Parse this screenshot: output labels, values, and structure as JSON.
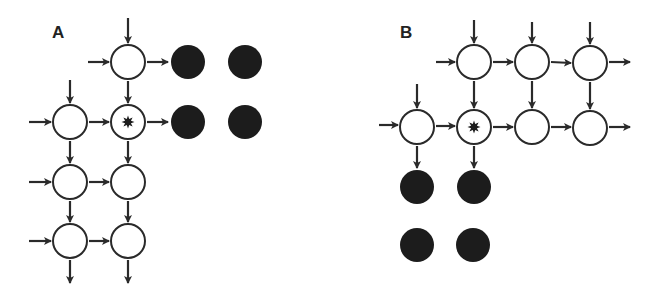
{
  "colors": {
    "line": "#2a2a2a",
    "filled": "#1c1c1c",
    "background": "#ffffff"
  },
  "node_radius": 17,
  "panels": [
    {
      "label": "A",
      "label_pos": [
        52,
        38
      ],
      "open_nodes": [
        {
          "x": 128,
          "y": 62,
          "marked": false
        },
        {
          "x": 70,
          "y": 122,
          "marked": false
        },
        {
          "x": 128,
          "y": 122,
          "marked": true
        },
        {
          "x": 70,
          "y": 182,
          "marked": false
        },
        {
          "x": 128,
          "y": 182,
          "marked": false
        },
        {
          "x": 70,
          "y": 241,
          "marked": false
        },
        {
          "x": 128,
          "y": 241,
          "marked": false
        }
      ],
      "filled_nodes": [
        {
          "x": 188,
          "y": 62
        },
        {
          "x": 245,
          "y": 62
        },
        {
          "x": 188,
          "y": 122
        },
        {
          "x": 245,
          "y": 122
        }
      ],
      "arrows": [
        [
          128,
          18,
          128,
          43
        ],
        [
          88,
          62,
          109,
          62
        ],
        [
          147,
          62,
          168,
          62
        ],
        [
          128,
          81,
          128,
          103
        ],
        [
          70,
          80,
          70,
          103
        ],
        [
          29,
          122,
          51,
          122
        ],
        [
          89,
          122,
          109,
          122
        ],
        [
          147,
          122,
          168,
          122
        ],
        [
          70,
          141,
          70,
          163
        ],
        [
          128,
          141,
          128,
          163
        ],
        [
          29,
          182,
          51,
          182
        ],
        [
          89,
          182,
          109,
          182
        ],
        [
          70,
          201,
          70,
          222
        ],
        [
          128,
          201,
          128,
          222
        ],
        [
          29,
          241,
          51,
          241
        ],
        [
          89,
          241,
          109,
          241
        ],
        [
          70,
          260,
          70,
          283
        ],
        [
          128,
          260,
          128,
          283
        ]
      ]
    },
    {
      "label": "B",
      "label_pos": [
        400,
        38
      ],
      "open_nodes": [
        {
          "x": 474,
          "y": 62,
          "marked": false
        },
        {
          "x": 532,
          "y": 62,
          "marked": false
        },
        {
          "x": 590,
          "y": 63,
          "marked": false
        },
        {
          "x": 417,
          "y": 127,
          "marked": false
        },
        {
          "x": 474,
          "y": 127,
          "marked": true
        },
        {
          "x": 532,
          "y": 127,
          "marked": false
        },
        {
          "x": 590,
          "y": 128,
          "marked": false
        }
      ],
      "filled_nodes": [
        {
          "x": 417,
          "y": 187
        },
        {
          "x": 474,
          "y": 187
        },
        {
          "x": 417,
          "y": 245
        },
        {
          "x": 473,
          "y": 245
        }
      ],
      "arrows": [
        [
          474,
          20,
          474,
          43
        ],
        [
          532,
          22,
          532,
          43
        ],
        [
          590,
          22,
          590,
          44
        ],
        [
          436,
          62,
          455,
          62
        ],
        [
          493,
          62,
          513,
          62
        ],
        [
          551,
          62,
          571,
          63
        ],
        [
          609,
          62,
          630,
          62
        ],
        [
          474,
          81,
          474,
          108
        ],
        [
          532,
          81,
          532,
          108
        ],
        [
          590,
          82,
          590,
          109
        ],
        [
          417,
          84,
          417,
          108
        ],
        [
          379,
          125,
          398,
          125
        ],
        [
          436,
          126,
          455,
          126
        ],
        [
          493,
          127,
          513,
          127
        ],
        [
          551,
          127,
          571,
          127
        ],
        [
          609,
          127,
          630,
          127
        ],
        [
          417,
          146,
          417,
          168
        ],
        [
          474,
          146,
          474,
          168
        ]
      ]
    }
  ]
}
